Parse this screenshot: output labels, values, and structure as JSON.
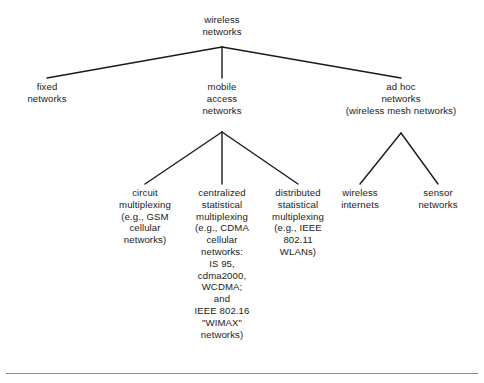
{
  "diagram": {
    "type": "tree",
    "line_color": "#1a1a1a",
    "text_color": "#1a1a1a",
    "background_color": "#ffffff",
    "nodes": {
      "root": {
        "label": "wireless\nnetworks",
        "level": 1
      },
      "fixed": {
        "label": "fixed\nnetworks",
        "level": 2
      },
      "mobile": {
        "label": "mobile\naccess\nnetworks",
        "level": 2
      },
      "adhoc": {
        "label": "ad hoc\nnetworks\n(wireless mesh networks)",
        "level": 2
      },
      "circuit": {
        "label": "circuit\nmultiplexing\n(e.g., GSM\ncellular\nnetworks)",
        "level": 3
      },
      "centralized": {
        "label": "centralized\nstatistical\nmultiplexing\n(e.g., CDMA\ncellular\nnetworks:\nIS 95,\ncdma2000,\nWCDMA;\nand\nIEEE 802.16\n\"WIMAX\"\nnetworks)",
        "level": 3
      },
      "distributed": {
        "label": "distributed\nstatistical\nmultiplexing\n(e.g., IEEE\n802.11\nWLANs)",
        "level": 3
      },
      "wireless_internets": {
        "label": "wireless\ninternets",
        "level": 3
      },
      "sensor": {
        "label": "sensor\nnetworks",
        "level": 3
      }
    },
    "edges": [
      {
        "from": "root",
        "to": "fixed"
      },
      {
        "from": "root",
        "to": "mobile"
      },
      {
        "from": "root",
        "to": "adhoc"
      },
      {
        "from": "mobile",
        "to": "circuit"
      },
      {
        "from": "mobile",
        "to": "centralized"
      },
      {
        "from": "mobile",
        "to": "distributed"
      },
      {
        "from": "adhoc",
        "to": "wireless_internets"
      },
      {
        "from": "adhoc",
        "to": "sensor"
      }
    ]
  }
}
